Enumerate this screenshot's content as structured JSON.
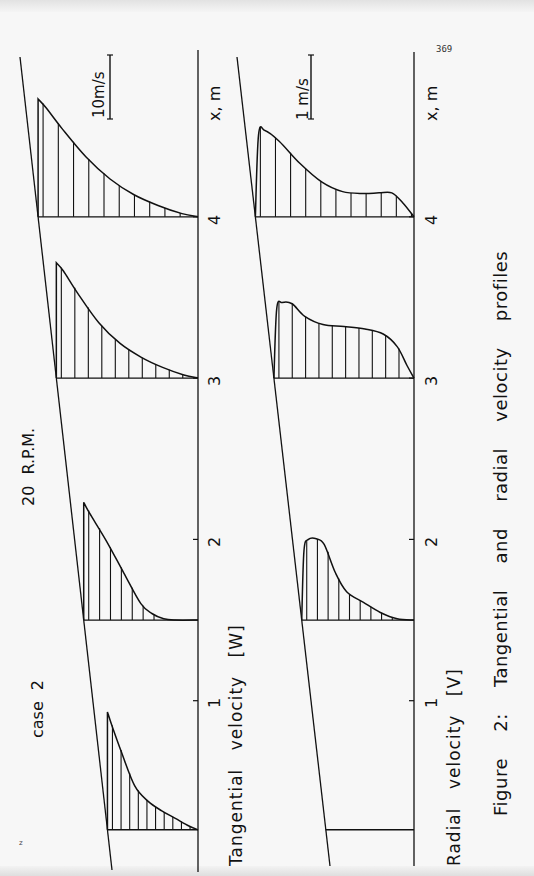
{
  "page": {
    "page_number": "369",
    "corner_mark": "z",
    "orientation": "rotated 90deg counter-clockwise"
  },
  "labels": {
    "case": "case 2",
    "rpm": "20 R.P.M.",
    "caption": "Figure 2: Tangential and radial velocity profiles",
    "top_panel_title": "Tangential velocity [W]",
    "bottom_panel_title": "Radial velocity [V]",
    "top_scale": "10m/s",
    "bottom_scale": "1 m/s",
    "axis_label_top": "x, m",
    "axis_label_bottom": "x, m",
    "ticks": [
      "1",
      "2",
      "3",
      "4"
    ]
  },
  "colors": {
    "ink": "#111111",
    "paper": "#f7f7f7"
  },
  "chart_data": [
    {
      "type": "line",
      "title": "Tangential velocity [W]",
      "subtitle": "case 2, 20 R.P.M.",
      "xlabel": "x, m",
      "ylabel": "W (m/s)",
      "scale_bar": {
        "label": "10m/s",
        "value": 10
      },
      "x_ticks": [
        1,
        2,
        3,
        4
      ],
      "stations": [
        {
          "x": 0.2,
          "r": [
            0,
            0.05,
            0.15,
            0.3,
            0.45,
            0.6,
            0.75,
            0.9,
            1.0
          ],
          "v": [
            18.7,
            16.5,
            12.5,
            7.0,
            4.5,
            3.0,
            1.8,
            0.6,
            0
          ]
        },
        {
          "x": 1.5,
          "r": [
            0,
            0.05,
            0.2,
            0.35,
            0.5,
            0.6,
            0.7,
            0.8,
            1.0
          ],
          "v": [
            18.7,
            17.0,
            12.5,
            7.5,
            2.6,
            1.0,
            0.2,
            0,
            0
          ]
        },
        {
          "x": 3.0,
          "r": [
            0,
            0.05,
            0.15,
            0.3,
            0.45,
            0.6,
            0.75,
            0.9,
            1.0
          ],
          "v": [
            18.3,
            17.0,
            13.5,
            8.8,
            5.5,
            3.3,
            1.7,
            0.5,
            0
          ]
        },
        {
          "x": 4.0,
          "r": [
            0,
            0.05,
            0.15,
            0.3,
            0.45,
            0.6,
            0.75,
            0.9,
            1.0
          ],
          "v": [
            18.7,
            17.3,
            14.0,
            9.5,
            6.0,
            3.5,
            1.8,
            0.5,
            0
          ]
        }
      ]
    },
    {
      "type": "line",
      "title": "Radial velocity [V]",
      "subtitle": "case 2, 20 R.P.M.",
      "xlabel": "x, m",
      "ylabel": "V (m/s)",
      "scale_bar": {
        "label": "1 m/s",
        "value": 1
      },
      "x_ticks": [
        1,
        2,
        3,
        4
      ],
      "stations": [
        {
          "x": 0.2,
          "r": [
            0,
            1.0
          ],
          "v": [
            0,
            0
          ]
        },
        {
          "x": 1.5,
          "r": [
            0,
            0.02,
            0.06,
            0.13,
            0.2,
            0.3,
            0.4,
            0.55,
            0.7,
            0.85,
            1.0
          ],
          "v": [
            0,
            1.1,
            1.28,
            1.29,
            1.2,
            0.75,
            0.45,
            0.28,
            0.12,
            0.02,
            0
          ]
        },
        {
          "x": 3.0,
          "r": [
            0,
            0.02,
            0.06,
            0.13,
            0.22,
            0.35,
            0.5,
            0.65,
            0.78,
            0.88,
            0.95,
            1.0
          ],
          "v": [
            0,
            1.1,
            1.2,
            1.18,
            0.98,
            0.85,
            0.82,
            0.78,
            0.7,
            0.5,
            0.2,
            0
          ]
        },
        {
          "x": 4.0,
          "r": [
            0,
            0.02,
            0.06,
            0.15,
            0.28,
            0.42,
            0.55,
            0.68,
            0.78,
            0.86,
            0.93,
            1.0
          ],
          "v": [
            0,
            1.3,
            1.37,
            1.2,
            0.85,
            0.55,
            0.4,
            0.37,
            0.38,
            0.38,
            0.22,
            0
          ]
        }
      ]
    }
  ]
}
